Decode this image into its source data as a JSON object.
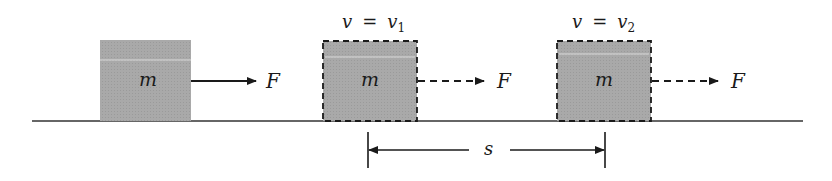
{
  "diagram": {
    "colors": {
      "block_fill": "#a9a9a9",
      "ink": "#1a1a1a",
      "highlight": "#d9d9d9"
    },
    "blocks": [
      {
        "mass_label": "m",
        "force_label": "F",
        "velocity_label": null,
        "style": "solid"
      },
      {
        "mass_label": "m",
        "force_label": "F",
        "velocity_label": {
          "lhs": "v",
          "eq": "=",
          "rhs": "v",
          "sub": "1"
        },
        "style": "dashed"
      },
      {
        "mass_label": "m",
        "force_label": "F",
        "velocity_label": {
          "lhs": "v",
          "eq": "=",
          "rhs": "v",
          "sub": "2"
        },
        "style": "dashed"
      }
    ],
    "displacement": {
      "label": "s"
    }
  }
}
